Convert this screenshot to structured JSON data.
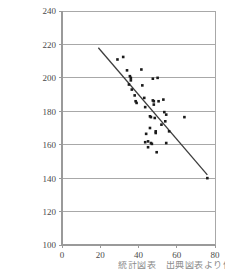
{
  "chart_data": {
    "type": "scatter",
    "title": "",
    "subtitle": "",
    "xlabel": "",
    "ylabel": "",
    "xlim": [
      0,
      80
    ],
    "ylim": [
      100,
      240
    ],
    "xticks": [
      0,
      20,
      40,
      60,
      80
    ],
    "yticks": [
      100,
      120,
      140,
      160,
      180,
      200,
      220,
      240
    ],
    "grid": "horizontal",
    "legend": "none",
    "point_color": "#1a1a1a",
    "line_color": "#3d3d3d",
    "axis_color": "#9a9a9a",
    "grid_color": "#a8a8a8",
    "points": [
      [
        29.0,
        211.0
      ],
      [
        32.0,
        212.5
      ],
      [
        34.0,
        204.5
      ],
      [
        35.0,
        196.0
      ],
      [
        35.5,
        201.0
      ],
      [
        36.0,
        200.0
      ],
      [
        36.0,
        198.5
      ],
      [
        36.5,
        193.0
      ],
      [
        38.0,
        189.5
      ],
      [
        38.5,
        186.0
      ],
      [
        39.0,
        185.0
      ],
      [
        41.5,
        205.0
      ],
      [
        42.0,
        195.5
      ],
      [
        43.0,
        188.0
      ],
      [
        43.5,
        182.5
      ],
      [
        44.0,
        166.5
      ],
      [
        43.5,
        161.5
      ],
      [
        45.0,
        162.0
      ],
      [
        45.0,
        158.5
      ],
      [
        46.0,
        177.0
      ],
      [
        46.5,
        176.5
      ],
      [
        46.0,
        170.0
      ],
      [
        46.5,
        161.0
      ],
      [
        47.0,
        160.5
      ],
      [
        47.5,
        199.5
      ],
      [
        47.5,
        186.5
      ],
      [
        48.0,
        186.0
      ],
      [
        48.0,
        184.0
      ],
      [
        48.5,
        176.0
      ],
      [
        49.0,
        168.0
      ],
      [
        49.0,
        167.0
      ],
      [
        49.5,
        155.5
      ],
      [
        50.0,
        200.0
      ],
      [
        50.5,
        186.0
      ],
      [
        52.0,
        172.0
      ],
      [
        53.0,
        187.0
      ],
      [
        53.5,
        179.5
      ],
      [
        54.0,
        174.0
      ],
      [
        54.5,
        178.0
      ],
      [
        54.5,
        161.0
      ],
      [
        56.0,
        168.0
      ],
      [
        64.0,
        176.5
      ],
      [
        76.0,
        140.0
      ]
    ],
    "trendline": {
      "x0": 19.0,
      "y0": 218.0,
      "x1": 76.0,
      "y1": 142.0
    }
  },
  "caption": {
    "text": "統計図表　出典図表より作成"
  },
  "icons": {
    "scatter_point": "filled-square-marker"
  }
}
